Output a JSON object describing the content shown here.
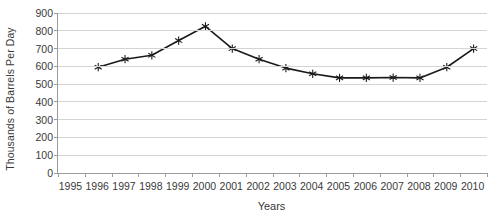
{
  "chart_data": {
    "type": "line",
    "title": "",
    "xlabel": "Years",
    "ylabel": "Thousands of Barrels Per Day",
    "categories": [
      "1995",
      "1996",
      "1997",
      "1998",
      "1999",
      "2000",
      "2001",
      "2002",
      "2003",
      "2004",
      "2005",
      "2006",
      "2007",
      "2008",
      "2009",
      "2010"
    ],
    "x": [
      1996,
      1997,
      1998,
      1999,
      2000,
      2001,
      2002,
      2003,
      2004,
      2005,
      2006,
      2007,
      2008,
      2009,
      2010
    ],
    "values": [
      595,
      640,
      662,
      745,
      825,
      700,
      640,
      590,
      558,
      535,
      535,
      537,
      535,
      595,
      700,
      790
    ],
    "series": [
      {
        "name": "Thousands of Barrels Per Day",
        "points": [
          {
            "x": "1996",
            "y": 595
          },
          {
            "x": "1997",
            "y": 640
          },
          {
            "x": "1998",
            "y": 662
          },
          {
            "x": "1999",
            "y": 745
          },
          {
            "x": "2000",
            "y": 825
          },
          {
            "x": "2001",
            "y": 700
          },
          {
            "x": "2002",
            "y": 640
          },
          {
            "x": "2003",
            "y": 590
          },
          {
            "x": "2004",
            "y": 558
          },
          {
            "x": "2005",
            "y": 535
          },
          {
            "x": "2006",
            "y": 535
          },
          {
            "x": "2007",
            "y": 537
          },
          {
            "x": "2008",
            "y": 535
          },
          {
            "x": "2009",
            "y": 595
          },
          {
            "x": "2010",
            "y": 700
          },
          {
            "x": "2010b",
            "y": 790
          }
        ]
      }
    ],
    "ylim": [
      0,
      900
    ],
    "ytick_labels": [
      "0",
      "100",
      "200",
      "300",
      "400",
      "500",
      "600",
      "700",
      "800",
      "900"
    ],
    "ytick_values": [
      0,
      100,
      200,
      300,
      400,
      500,
      600,
      700,
      800,
      900
    ],
    "grid": true,
    "legend": "none",
    "marker": "star",
    "line_color": "#1a1a1a",
    "grid_color": "#d4d4d4",
    "axis_color": "#9b9b9b",
    "background": "#ffffff"
  }
}
